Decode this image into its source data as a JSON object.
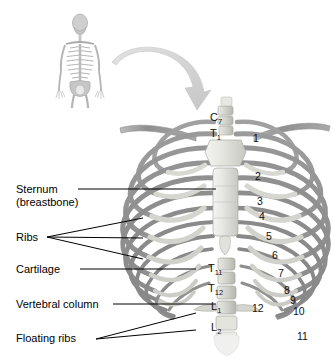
{
  "figure": {
    "background_color": "#ffffff",
    "bone_color": "#9a9a9a",
    "cartilage_color": "#d8d8d2",
    "sternum_color": "#ededea",
    "arrow_color": "#d2d2d2",
    "leader_color": "#000000"
  },
  "skeleton_inset": {
    "name": "full human skeleton, anterior view",
    "x": 40,
    "y": 5,
    "width": 80,
    "height": 100
  },
  "arrow": {
    "name": "curved arrow from skeleton to rib cage",
    "direction": "down-right"
  },
  "labels": [
    {
      "id": "sternum",
      "line1": "Sternum",
      "line2": "(breastbone)",
      "x": 16,
      "y": 183,
      "leaders": 1
    },
    {
      "id": "ribs",
      "line1": "Ribs",
      "line2": "",
      "x": 16,
      "y": 231,
      "leaders": 3
    },
    {
      "id": "cartilage",
      "line1": "Cartilage",
      "line2": "",
      "x": 16,
      "y": 263,
      "leaders": 1
    },
    {
      "id": "vertebral-column",
      "line1": "Vertebral column",
      "line2": "",
      "x": 16,
      "y": 298,
      "leaders": 1
    },
    {
      "id": "floating-ribs",
      "line1": "Floating ribs",
      "line2": "",
      "x": 16,
      "y": 332,
      "leaders": 2
    }
  ],
  "vertebrae": [
    {
      "letter": "C",
      "number": "7",
      "x": 210,
      "y": 112
    },
    {
      "letter": "T",
      "number": "1",
      "x": 210,
      "y": 128
    },
    {
      "letter": "T",
      "number": "11",
      "x": 208,
      "y": 263
    },
    {
      "letter": "T",
      "number": "12",
      "x": 208,
      "y": 283
    },
    {
      "letter": "L",
      "number": "1",
      "x": 211,
      "y": 301
    },
    {
      "letter": "L",
      "number": "2",
      "x": 211,
      "y": 322
    }
  ],
  "rib_numbers": [
    {
      "label": "1",
      "x": 253,
      "y": 133
    },
    {
      "label": "2",
      "x": 255,
      "y": 171
    },
    {
      "label": "3",
      "x": 257,
      "y": 196
    },
    {
      "label": "4",
      "x": 259,
      "y": 211
    },
    {
      "label": "5",
      "x": 266,
      "y": 231
    },
    {
      "label": "6",
      "x": 272,
      "y": 250
    },
    {
      "label": "7",
      "x": 278,
      "y": 268
    },
    {
      "label": "8",
      "x": 284,
      "y": 285
    },
    {
      "label": "9",
      "x": 290,
      "y": 295
    },
    {
      "label": "10",
      "x": 293,
      "y": 306
    },
    {
      "label": "11",
      "x": 297,
      "y": 331
    },
    {
      "label": "12",
      "x": 252,
      "y": 303
    }
  ]
}
